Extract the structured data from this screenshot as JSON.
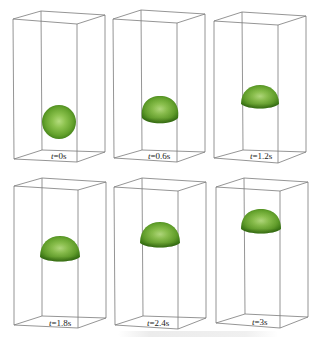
{
  "figure": {
    "colors": {
      "box_edge": "#7a7a7a",
      "droplet_light": "#9fd060",
      "droplet_mid": "#6aa82e",
      "droplet_dark": "#3f7d17",
      "label": "#222222"
    },
    "panels": [
      {
        "label_prefix": "t",
        "label_value": "=0s",
        "shape": "sphere"
      },
      {
        "label_prefix": "t",
        "label_value": "=0.6s",
        "shape": "flattened-sphere"
      },
      {
        "label_prefix": "t",
        "label_value": "=1.2s",
        "shape": "cap"
      },
      {
        "label_prefix": "t",
        "label_value": "=1.8s",
        "shape": "cap"
      },
      {
        "label_prefix": "t",
        "label_value": "=2.4s",
        "shape": "cap"
      },
      {
        "label_prefix": "t",
        "label_value": "=3s",
        "shape": "cap"
      }
    ]
  }
}
